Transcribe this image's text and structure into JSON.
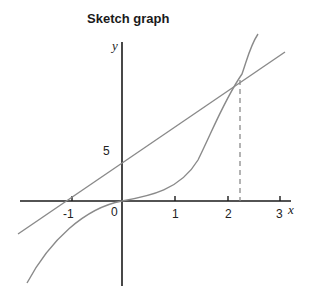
{
  "title": "Sketch graph",
  "axes": {
    "x_label": "x",
    "y_label": "y",
    "x_ticks": [
      "-1",
      "0",
      "1",
      "2",
      "3"
    ],
    "y_ticks": [
      "5"
    ]
  },
  "colors": {
    "axis": "#1a1a1a",
    "curve": "#8a8a8a",
    "line": "#8a8a8a",
    "dashed": "#8a8a8a"
  },
  "elements": {
    "line_label": "straight line with y-intercept 5",
    "curve_label": "curve through origin",
    "intersection_x": "≈2.2"
  }
}
